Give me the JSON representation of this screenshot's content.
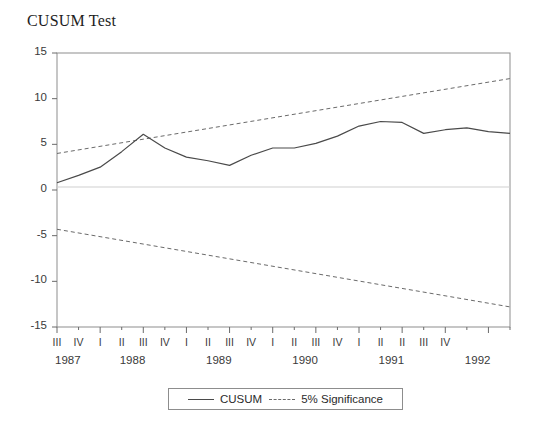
{
  "chart_data": {
    "type": "line",
    "title": "CUSUM Test",
    "xlabel": "",
    "ylabel": "",
    "ylim": [
      -15,
      15
    ],
    "yticks": [
      15,
      10,
      5,
      0,
      -5,
      -10,
      -15
    ],
    "grid": false,
    "zero_line": true,
    "legend_position": "bottom-center",
    "x": [
      "1987 III",
      "1987 IV",
      "1988 I",
      "1988 II",
      "1988 III",
      "1988 IV",
      "1989 I",
      "1989 II",
      "1989 III",
      "1989 IV",
      "1990 I",
      "1990 II",
      "1990 III",
      "1990 IV",
      "1991 I",
      "1991 II",
      "1991 III",
      "1991 IV",
      "1992 I",
      "1992 II",
      "1992 III",
      "1992 IV"
    ],
    "quarter_labels": [
      "III",
      "IV",
      "I",
      "II",
      "III",
      "IV",
      "I",
      "II",
      "III",
      "IV",
      "I",
      "II",
      "III",
      "IV",
      "I",
      "II",
      "III",
      "IV",
      "I",
      "II",
      "III",
      "IV"
    ],
    "quarter_labels_rendered": [
      "III",
      "IV",
      "I",
      "II",
      "III",
      "IV",
      "I",
      "II",
      "III",
      "IV",
      "I",
      "II",
      "III",
      "IV",
      "I",
      "II",
      "II",
      "III",
      "IV",
      "",
      "",
      ""
    ],
    "year_groups": [
      {
        "year": "1987",
        "quarters": [
          "III",
          "IV"
        ]
      },
      {
        "year": "1988",
        "quarters": [
          "I",
          "II",
          "III",
          "IV"
        ]
      },
      {
        "year": "1989",
        "quarters": [
          "I",
          "II",
          "III",
          "IV"
        ]
      },
      {
        "year": "1990",
        "quarters": [
          "I",
          "II",
          "III",
          "IV"
        ]
      },
      {
        "year": "1991",
        "quarters": [
          "I",
          "II",
          "III",
          "IV"
        ]
      },
      {
        "year": "1992",
        "quarters": [
          "I",
          "II",
          "III",
          "IV"
        ]
      }
    ],
    "series": [
      {
        "name": "CUSUM",
        "style": "solid",
        "color": "#4a4a4a",
        "values": [
          0.8,
          1.6,
          2.5,
          4.2,
          6.1,
          4.6,
          3.6,
          3.2,
          2.7,
          3.8,
          4.6,
          4.6,
          5.1,
          5.9,
          7.0,
          7.5,
          7.4,
          6.2,
          6.6,
          6.8,
          6.4,
          6.2
        ]
      },
      {
        "name": "5% Significance",
        "style": "dashed",
        "color": "#6a6a6a",
        "upper_endpoints": [
          4.0,
          12.2
        ],
        "lower_endpoints": [
          -4.3,
          -12.8
        ],
        "values_upper": [
          4.0,
          4.39,
          4.78,
          5.17,
          5.56,
          5.95,
          6.34,
          6.73,
          7.12,
          7.51,
          7.9,
          8.29,
          8.68,
          9.07,
          9.46,
          9.85,
          10.24,
          10.63,
          11.02,
          11.41,
          11.8,
          12.2
        ],
        "values_lower": [
          -4.3,
          -4.7,
          -5.11,
          -5.51,
          -5.91,
          -6.32,
          -6.72,
          -7.12,
          -7.53,
          -7.93,
          -8.33,
          -8.74,
          -9.14,
          -9.54,
          -9.95,
          -10.35,
          -10.75,
          -11.16,
          -11.56,
          -11.96,
          -12.37,
          -12.8
        ]
      }
    ],
    "legend": [
      {
        "label": "CUSUM",
        "style": "solid"
      },
      {
        "label": "5% Significance",
        "style": "dashed"
      }
    ]
  }
}
